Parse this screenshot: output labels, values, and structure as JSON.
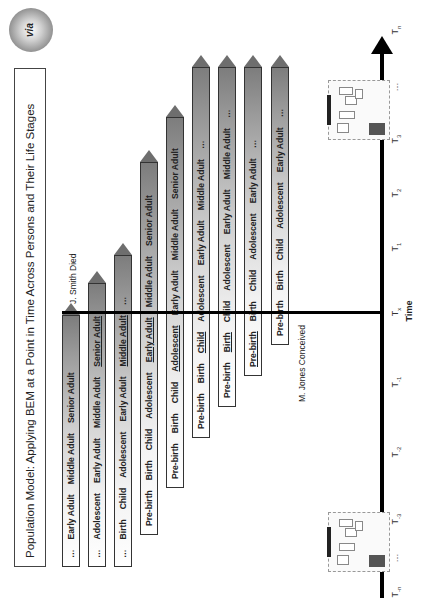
{
  "title": "Population Model: Applying BEM at a Point in Time Across Persons and Their Life Stages",
  "logo_text": "via",
  "events": {
    "death": "J. Smith Died",
    "conception": "M. Jones Conceived"
  },
  "axis": {
    "label": "Time",
    "ticks": [
      {
        "base": "T",
        "sub": "-n",
        "pos": 8
      },
      {
        "base": "…",
        "sub": "",
        "pos": 42
      },
      {
        "base": "T",
        "sub": "-3",
        "pos": 81
      },
      {
        "base": "T",
        "sub": "-2",
        "pos": 148
      },
      {
        "base": "T",
        "sub": "-1",
        "pos": 218
      },
      {
        "base": "T",
        "sub": "x",
        "pos": 288
      },
      {
        "base": "T",
        "sub": "1",
        "pos": 353
      },
      {
        "base": "T",
        "sub": "2",
        "pos": 407
      },
      {
        "base": "T",
        "sub": "3",
        "pos": 461
      },
      {
        "base": "…",
        "sub": "",
        "pos": 513
      },
      {
        "base": "T",
        "sub": "n",
        "pos": 570
      }
    ]
  },
  "persons": [
    {
      "start": 33,
      "end": 285,
      "y": 62,
      "stages": [
        {
          "label": "…"
        },
        {
          "label": "Early Adult"
        },
        {
          "label": "Middle Adult"
        },
        {
          "label": "Senior Adult"
        }
      ]
    },
    {
      "start": 33,
      "end": 317,
      "y": 88,
      "stages": [
        {
          "label": "…"
        },
        {
          "label": "Adolescent"
        },
        {
          "label": "Early Adult"
        },
        {
          "label": "Middle Adult"
        },
        {
          "label": "Senior Adult",
          "current": true
        }
      ]
    },
    {
      "start": 33,
      "end": 345,
      "y": 114,
      "stages": [
        {
          "label": "…"
        },
        {
          "label": "Birth"
        },
        {
          "label": "Child"
        },
        {
          "label": "Adolescent"
        },
        {
          "label": "Early Adult"
        },
        {
          "label": "Middle Adult",
          "current": true
        },
        {
          "label": "…"
        }
      ]
    },
    {
      "start": 65,
      "end": 438,
      "y": 140,
      "stages": [
        {
          "label": "Pre-birth"
        },
        {
          "label": "Birth"
        },
        {
          "label": "Child"
        },
        {
          "label": "Adolescent"
        },
        {
          "label": "Early Adult",
          "current": true
        },
        {
          "label": "Middle Adult"
        },
        {
          "label": "Senior Adult"
        }
      ]
    },
    {
      "start": 112,
      "end": 483,
      "y": 166,
      "stages": [
        {
          "label": "Pre-birth"
        },
        {
          "label": "Birth"
        },
        {
          "label": "Child"
        },
        {
          "label": "Adolescent",
          "current": true
        },
        {
          "label": "Early Adult"
        },
        {
          "label": "Middle Adult"
        },
        {
          "label": "Senior Adult"
        }
      ]
    },
    {
      "start": 162,
      "end": 533,
      "y": 192,
      "stages": [
        {
          "label": "Pre-birth"
        },
        {
          "label": "Birth"
        },
        {
          "label": "Child",
          "current": true
        },
        {
          "label": "Adolescent"
        },
        {
          "label": "Early Adult"
        },
        {
          "label": "Middle Adult"
        },
        {
          "label": "…"
        }
      ]
    },
    {
      "start": 193,
      "end": 533,
      "y": 218,
      "stages": [
        {
          "label": "Pre-birth"
        },
        {
          "label": "Birth",
          "current": true
        },
        {
          "label": "Child"
        },
        {
          "label": "Adolescent"
        },
        {
          "label": "Early Adult"
        },
        {
          "label": "Middle Adult"
        },
        {
          "label": "…"
        }
      ]
    },
    {
      "start": 224,
      "end": 533,
      "y": 244,
      "stages": [
        {
          "label": "Pre-birth",
          "current": true
        },
        {
          "label": "Birth"
        },
        {
          "label": "Child"
        },
        {
          "label": "Adolescent"
        },
        {
          "label": "Early Adult"
        },
        {
          "label": "…"
        }
      ]
    },
    {
      "start": 255,
      "end": 533,
      "y": 271,
      "stages": [
        {
          "label": "Pre-birth"
        },
        {
          "label": "Birth"
        },
        {
          "label": "Child"
        },
        {
          "label": "Adolescent"
        },
        {
          "label": "Early Adult"
        },
        {
          "label": "…"
        }
      ]
    }
  ]
}
